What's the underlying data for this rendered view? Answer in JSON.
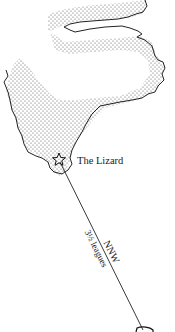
{
  "map": {
    "place_label": "The Lizard",
    "bearing_label": "NNW",
    "distance_label": "3½ leagues",
    "colors": {
      "land_outline": "#222222",
      "land_stipple": "#555555",
      "background": "#ffffff",
      "route_line": "#222222"
    },
    "icons": [
      "star-icon",
      "ship-icon"
    ]
  }
}
